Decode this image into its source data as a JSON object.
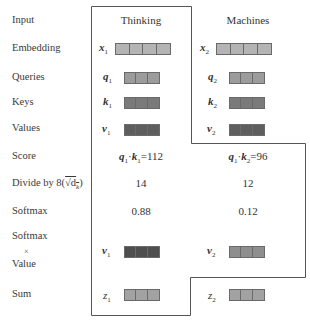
{
  "row_labels": {
    "input": "Input",
    "embedding": "Embedding",
    "queries": "Queries",
    "keys": "Keys",
    "values": "Values",
    "score": "Score",
    "divide_prefix": "Divide by 8(",
    "divide_sqrt": "√d",
    "divide_sub": "k",
    "divide_suffix": ")",
    "softmax": "Softmax",
    "softmax_value_top": "Softmax",
    "softmax_value_times": "×",
    "softmax_value_bottom": "Value",
    "sum": "Sum"
  },
  "columns": [
    {
      "header": "Thinking",
      "embedding": {
        "symbol": "x",
        "sub": "1"
      },
      "query": {
        "symbol": "q",
        "sub": "1"
      },
      "key": {
        "symbol": "k",
        "sub": "1"
      },
      "value": {
        "symbol": "v",
        "sub": "1"
      },
      "score": {
        "q": "q",
        "q_sub": "1",
        "dot": "·",
        "k": "k",
        "k_sub": "1",
        "eq": "=112"
      },
      "divided": "14",
      "softmax": "0.88",
      "weighted_value": {
        "symbol": "v",
        "sub": "1"
      },
      "sum": {
        "symbol": "z",
        "sub": "1"
      }
    },
    {
      "header": "Machines",
      "embedding": {
        "symbol": "x",
        "sub": "2"
      },
      "query": {
        "symbol": "q",
        "sub": "2"
      },
      "key": {
        "symbol": "k",
        "sub": "2"
      },
      "value": {
        "symbol": "v",
        "sub": "2"
      },
      "score": {
        "q": "q",
        "q_sub": "1",
        "dot": "·",
        "k": "k",
        "k_sub": "2",
        "eq": "=96"
      },
      "divided": "12",
      "softmax": "0.12",
      "weighted_value": {
        "symbol": "v",
        "sub": "2"
      },
      "sum": {
        "symbol": "z",
        "sub": "2"
      }
    }
  ],
  "colors": {
    "embedding": "#b4b4b4",
    "query": "#9c9c9c",
    "key": "#7a7a7a",
    "value": "#5e5e5e",
    "weighted_value_1": "#4e4e4e",
    "weighted_value_2": "#8e8e8e",
    "sum": "#a2a2a2",
    "frame": "#555555"
  }
}
